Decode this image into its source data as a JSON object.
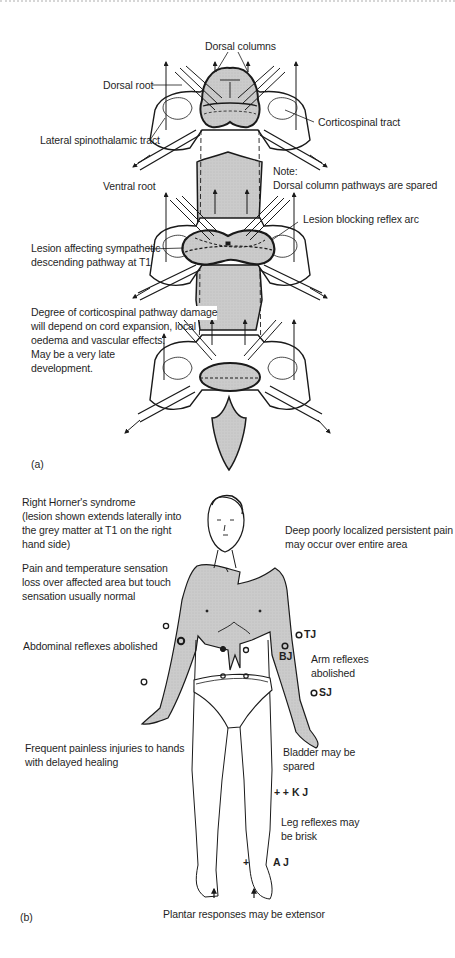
{
  "figure": {
    "panel_a": {
      "label": "(a)",
      "annotations": {
        "dorsal_columns": "Dorsal columns",
        "dorsal_root": "Dorsal root",
        "corticospinal_tract": "Corticospinal tract",
        "lateral_spinothalamic_tract": "Lateral spinothalamic tract",
        "ventral_root": "Ventral root",
        "note_title": "Note:",
        "note_text": "Dorsal column pathways are spared",
        "lesion_reflex_arc": "Lesion blocking reflex arc",
        "lesion_sympathetic_line1": "Lesion affecting sympathetic",
        "lesion_sympathetic_line2": "descending pathway at T1",
        "corticospinal_damage_line1": "Degree of corticospinal pathway damage",
        "corticospinal_damage_line2": "will depend on cord expansion, local",
        "corticospinal_damage_line3": "oedema and vascular effects.",
        "corticospinal_damage_line4": "May be a very late",
        "corticospinal_damage_line5": "development."
      }
    },
    "panel_b": {
      "label": "(b)",
      "annotations": {
        "horner_line1": "Right Horner's syndrome",
        "horner_line2": "(lesion shown extends laterally into",
        "horner_line3": "the grey matter at T1 on the right",
        "horner_line4": "hand side)",
        "pain_line1": "Pain and temperature sensation",
        "pain_line2": "loss over affected area but touch",
        "pain_line3": "sensation usually normal",
        "deep_pain_line1": "Deep poorly localized persistent pain",
        "deep_pain_line2": "may occur over entire area",
        "abdominal": "Abdominal reflexes abolished",
        "arm_reflexes_line1": "Arm reflexes",
        "arm_reflexes_line2": "abolished",
        "hands_line1": "Frequent painless injuries to hands",
        "hands_line2": "with delayed healing",
        "bladder_line1": "Bladder may be",
        "bladder_line2": "spared",
        "leg_reflexes_line1": "Leg reflexes may",
        "leg_reflexes_line2": "be brisk",
        "plantar": "Plantar responses may be extensor"
      },
      "reflex_markers": {
        "tj": "TJ",
        "bj": "BJ",
        "sj": "SJ",
        "kj": "K J",
        "kj_sign": "+ +",
        "aj": "A J",
        "aj_sign": "+",
        "absent_symbol": "O"
      }
    },
    "colors": {
      "shade": "#c9c9c9",
      "line": "#1a1a1a",
      "text": "#1f1f1f"
    }
  }
}
